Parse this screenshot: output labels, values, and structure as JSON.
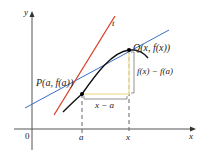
{
  "figure": {
    "axes": {
      "x_label": "x",
      "y_label": "y",
      "origin_label": "0"
    },
    "points": {
      "P": {
        "label": "P(a, f(a))"
      },
      "Q": {
        "label": "Q(x, f(x))"
      }
    },
    "ticks": {
      "a": "a",
      "x": "x"
    },
    "lines": {
      "tangent": {
        "label": "t",
        "color": "#d9402b"
      },
      "secant": {
        "color": "#3a6fc4"
      }
    },
    "brackets": {
      "horizontal": "x − a",
      "vertical": "f(x) − f(a)",
      "color": "#f2e3a6"
    },
    "curve_color": "#111111"
  }
}
